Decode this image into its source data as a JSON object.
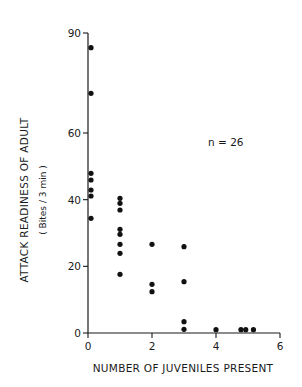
{
  "chart_data": {
    "type": "scatter",
    "title": "",
    "xlabel": "NUMBER OF JUVENILES PRESENT",
    "ylabel": "ATTACK READINESS OF ADULT",
    "ylabel_sub": "( Bites / 3 min )",
    "xlim": [
      0,
      6
    ],
    "ylim": [
      0,
      90
    ],
    "xticks": [
      0,
      2,
      4,
      6
    ],
    "yticks": [
      0,
      20,
      40,
      60,
      90
    ],
    "grid": false,
    "annotation": "n = 26",
    "series": [
      {
        "name": "observations",
        "points": [
          {
            "x": 0,
            "y": 85.6
          },
          {
            "x": 0,
            "y": 71.9
          },
          {
            "x": 0,
            "y": 47.9
          },
          {
            "x": 0,
            "y": 45.9
          },
          {
            "x": 0,
            "y": 42.9
          },
          {
            "x": 0,
            "y": 41.1
          },
          {
            "x": 0,
            "y": 34.4
          },
          {
            "x": 1,
            "y": 40.4
          },
          {
            "x": 1,
            "y": 38.9
          },
          {
            "x": 1,
            "y": 36.9
          },
          {
            "x": 1,
            "y": 31.1
          },
          {
            "x": 1,
            "y": 29.6
          },
          {
            "x": 1,
            "y": 26.6
          },
          {
            "x": 1,
            "y": 23.9
          },
          {
            "x": 1,
            "y": 17.6
          },
          {
            "x": 2,
            "y": 26.6
          },
          {
            "x": 2,
            "y": 14.6
          },
          {
            "x": 2,
            "y": 12.4
          },
          {
            "x": 3,
            "y": 25.9
          },
          {
            "x": 3,
            "y": 15.4
          },
          {
            "x": 3,
            "y": 3.4
          },
          {
            "x": 3,
            "y": 1.1
          },
          {
            "x": 4,
            "y": 1.0
          },
          {
            "x": 4.78,
            "y": 1.0
          },
          {
            "x": 4.93,
            "y": 1.0
          },
          {
            "x": 5.17,
            "y": 1.0
          }
        ]
      }
    ]
  }
}
